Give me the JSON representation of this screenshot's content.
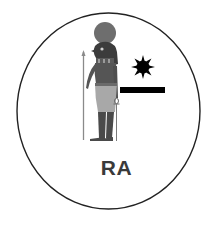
{
  "emblem": {
    "label": "RA",
    "colors": {
      "background": "#ffffff",
      "ring": "#222222",
      "figure_dark": "#4a4a4a",
      "figure_mid": "#6a6a6a",
      "figure_light": "#a8a8a8",
      "sun_disk_head": "#6e6e6e",
      "sun_glyph": "#000000",
      "bar": "#000000",
      "label": "#3a3a3a"
    },
    "icons": {
      "figure": "ra-falcon-god-icon",
      "sun": "sun-icon",
      "bar": "horizon-bar-icon"
    }
  }
}
